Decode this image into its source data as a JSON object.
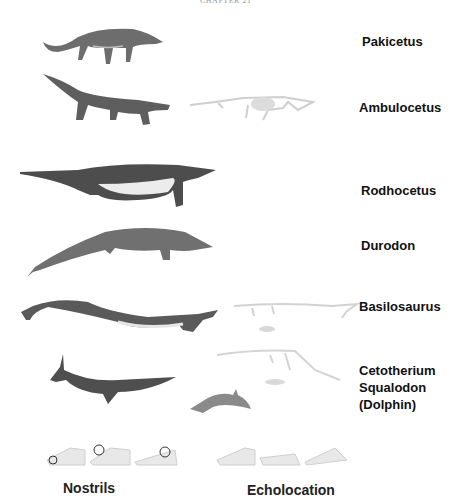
{
  "header": {
    "text": "CHAPTER 21"
  },
  "species": [
    {
      "name": "Pakicetus"
    },
    {
      "name": "Ambulocetus"
    },
    {
      "name": "Rodhocetus"
    },
    {
      "name": "Durodon"
    },
    {
      "name": "Basilosaurus"
    },
    {
      "name": "Cetotherium"
    },
    {
      "name": "Squalodon"
    },
    {
      "name": "(Dolphin)"
    }
  ],
  "bottom_labels": {
    "nostrils": "Nostrils",
    "echolocation": "Echolocation"
  },
  "colors": {
    "animal_dark": "#5a5a5a",
    "animal_mid": "#8a8a8a",
    "belly": "#e6e6e6",
    "skeleton": "#cfcfcf",
    "text": "#111111"
  }
}
